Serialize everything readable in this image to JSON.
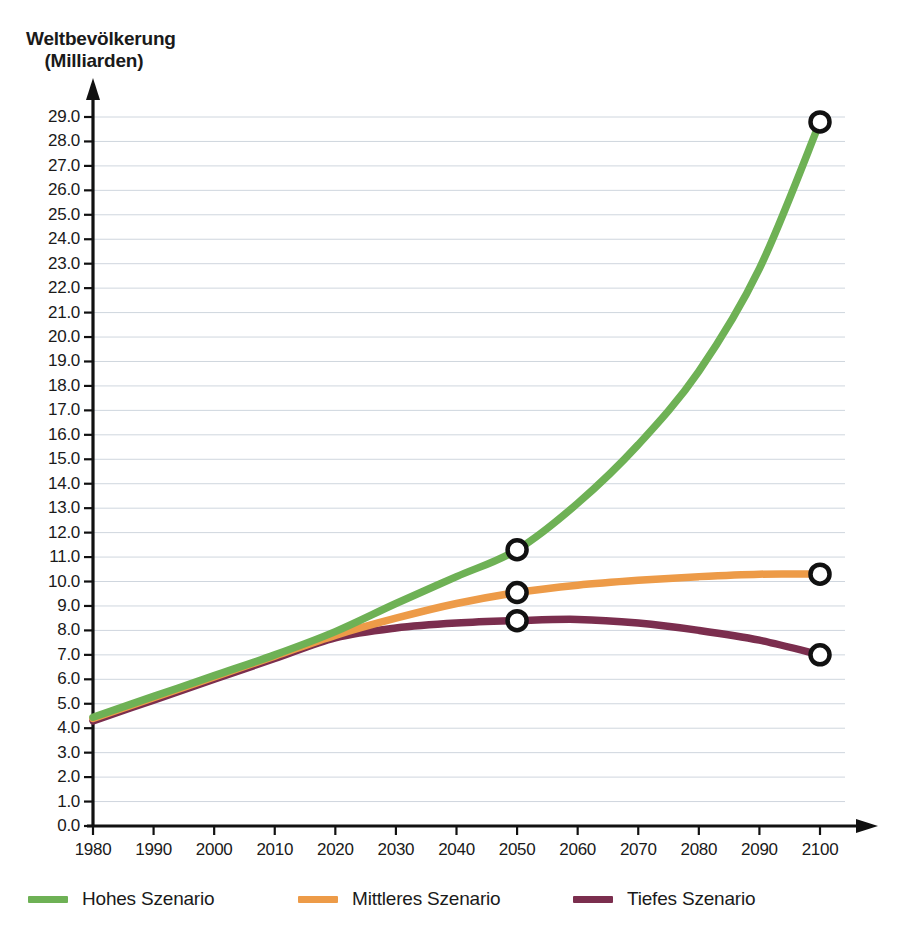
{
  "chart_data": {
    "type": "line",
    "title": "Weltbevölkerung (Milliarden)",
    "title_line1": "Weltbevölkerung",
    "title_line2": "(Milliarden)",
    "xlabel": "",
    "ylabel": "Weltbevölkerung (Milliarden)",
    "xlim": [
      1980,
      2100
    ],
    "ylim": [
      0.0,
      29.0
    ],
    "grid": true,
    "legend_position": "bottom",
    "x_ticks": [
      1980,
      1990,
      2000,
      2010,
      2020,
      2030,
      2040,
      2050,
      2060,
      2070,
      2080,
      2090,
      2100
    ],
    "y_ticks": [
      "0.0",
      "1.0",
      "2.0",
      "3.0",
      "4.0",
      "5.0",
      "6.0",
      "7.0",
      "8.0",
      "9.0",
      "10.0",
      "11.0",
      "12.0",
      "13.0",
      "14.0",
      "15.0",
      "16.0",
      "17.0",
      "18.0",
      "19.0",
      "20.0",
      "21.0",
      "22.0",
      "23.0",
      "24.0",
      "25.0",
      "26.0",
      "27.0",
      "28.0",
      "29.0"
    ],
    "x": [
      1980,
      1990,
      2000,
      2010,
      2020,
      2030,
      2040,
      2050,
      2060,
      2070,
      2080,
      2090,
      2100
    ],
    "series": [
      {
        "name": "Hohes Szenario",
        "color": "#6EB155",
        "values": [
          4.45,
          5.3,
          6.15,
          7.0,
          7.95,
          9.1,
          10.2,
          11.3,
          13.2,
          15.6,
          18.6,
          22.8,
          28.8
        ],
        "markers": [
          {
            "x": 2050,
            "y": 11.3
          },
          {
            "x": 2100,
            "y": 28.8
          }
        ]
      },
      {
        "name": "Mittleres Szenario",
        "color": "#ED9B48",
        "values": [
          4.4,
          5.25,
          6.1,
          6.95,
          7.8,
          8.5,
          9.1,
          9.55,
          9.85,
          10.05,
          10.2,
          10.3,
          10.3
        ],
        "markers": [
          {
            "x": 2050,
            "y": 9.55
          },
          {
            "x": 2100,
            "y": 10.3
          }
        ]
      },
      {
        "name": "Tiefes Szenario",
        "color": "#7B2E4E",
        "values": [
          4.3,
          5.15,
          6.0,
          6.85,
          7.7,
          8.1,
          8.3,
          8.4,
          8.45,
          8.3,
          8.0,
          7.6,
          7.0
        ],
        "markers": [
          {
            "x": 2050,
            "y": 8.4
          },
          {
            "x": 2100,
            "y": 7.0
          }
        ]
      }
    ],
    "marker_style": {
      "shape": "open-circle",
      "stroke": "#111111",
      "fill": "#ffffff"
    },
    "axis_color": "#111111",
    "grid_color": "#cfd6de",
    "background": "#ffffff"
  }
}
